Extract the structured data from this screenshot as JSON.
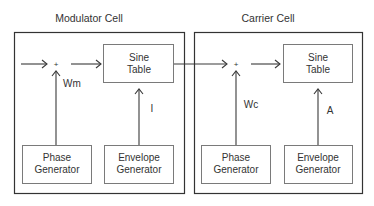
{
  "diagram": {
    "modulator": {
      "title": "Modulator Cell",
      "sine_table": [
        "Sine",
        "Table"
      ],
      "phase_generator": [
        "Phase",
        "Generator"
      ],
      "envelope_generator": [
        "Envelope",
        "Generator"
      ],
      "adder_symbol": "+",
      "phase_label": "Wm",
      "envelope_label": "I"
    },
    "carrier": {
      "title": "Carrier Cell",
      "sine_table": [
        "Sine",
        "Table"
      ],
      "phase_generator": [
        "Phase",
        "Generator"
      ],
      "envelope_generator": [
        "Envelope",
        "Generator"
      ],
      "adder_symbol": "+",
      "phase_label": "Wc",
      "envelope_label": "A"
    },
    "colors": {
      "outer_border": "#333333",
      "inner_border": "#7a7a7a",
      "text": "#333333"
    }
  }
}
